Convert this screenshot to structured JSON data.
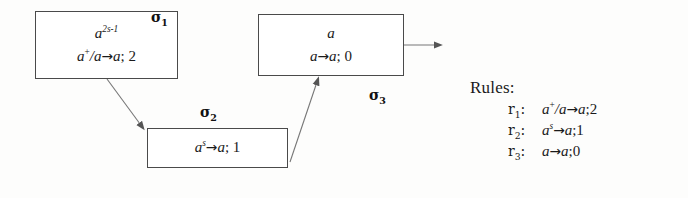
{
  "diagram": {
    "neurons": [
      {
        "id": "sigma1",
        "label": "σ",
        "index": "1",
        "spikes": "a",
        "spikes_exponent": "2s-1",
        "rule": "a⁺/a→a;2",
        "rule_prefix": "a",
        "rule_prefix_sup": "+",
        "rule_mid": "/a",
        "rule_arrow": "→",
        "rule_suffix": "a",
        "rule_delay": "; 2"
      },
      {
        "id": "sigma2",
        "label": "σ",
        "index": "2",
        "spikes": "",
        "spikes_exponent": "",
        "rule": "aˢ→a;1",
        "rule_prefix": "a",
        "rule_prefix_sup": "s",
        "rule_mid": "",
        "rule_arrow": "→",
        "rule_suffix": "a",
        "rule_delay": "; 1"
      },
      {
        "id": "sigma3",
        "label": "σ",
        "index": "3",
        "spikes": "a",
        "spikes_exponent": "",
        "rule": "a→a;0",
        "rule_prefix": "a",
        "rule_prefix_sup": "",
        "rule_mid": "",
        "rule_arrow": "→",
        "rule_suffix": "a",
        "rule_delay": "; 0"
      }
    ],
    "synapses": [
      {
        "from": "sigma1",
        "to": "sigma2"
      },
      {
        "from": "sigma2",
        "to": "sigma3"
      }
    ],
    "output_arrow": {
      "from": "sigma3",
      "direction": "right"
    },
    "colors": {
      "box_border": "#4a4a4a",
      "arrow": "#555555",
      "text": "#1a1a1a",
      "background": "#fdfdfc"
    }
  },
  "rules": {
    "heading": "Rules:",
    "items": [
      {
        "key": "r",
        "key_index": "1",
        "colon": ":",
        "base": "a",
        "sup": "+",
        "mid": "/a",
        "arrow": "→",
        "target": "a",
        "delay": ";2",
        "full": "a⁺/a→a;2"
      },
      {
        "key": "r",
        "key_index": "2",
        "colon": ":",
        "base": "a",
        "sup": "s",
        "mid": "",
        "arrow": "→",
        "target": "a",
        "delay": ";1",
        "full": "aˢ→a;1"
      },
      {
        "key": "r",
        "key_index": "3",
        "colon": ":",
        "base": "a",
        "sup": "",
        "mid": "",
        "arrow": "→",
        "target": "a",
        "delay": ";0",
        "full": "a→a;0"
      }
    ]
  }
}
